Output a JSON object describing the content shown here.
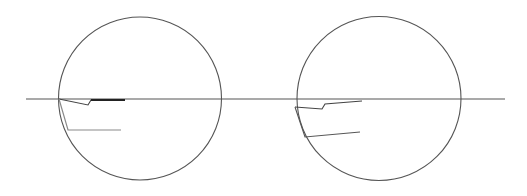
{
  "diagram": {
    "width": 527,
    "height": 196,
    "background": "#ffffff",
    "colors": {
      "circle": "#555555",
      "baseline": "#555555",
      "upper_polyline": "#444444",
      "upper_overlap": "#222222",
      "lower_polyline_left": "#8a8a8a",
      "lower_polyline_right": "#555555"
    },
    "baseline": {
      "x1": 26,
      "y1": 99,
      "x2": 505,
      "y2": 99
    },
    "figures": [
      {
        "name": "left-figure",
        "circle": {
          "cx": 140,
          "cy": 98.5,
          "r": 81.5
        },
        "upper_polyline": "59,99 88,105 91,100 125,100",
        "overlap_segment": {
          "x1": 91,
          "y1": 100,
          "x2": 125,
          "y2": 100
        },
        "lower_polyline": "59,99 68,130 121,130"
      },
      {
        "name": "right-figure",
        "circle": {
          "cx": 379,
          "cy": 98.5,
          "r": 82
        },
        "upper_polyline": "295,107 322,109 325,104 362,101",
        "lower_polyline": "295,107 305,137 360,132"
      }
    ]
  }
}
